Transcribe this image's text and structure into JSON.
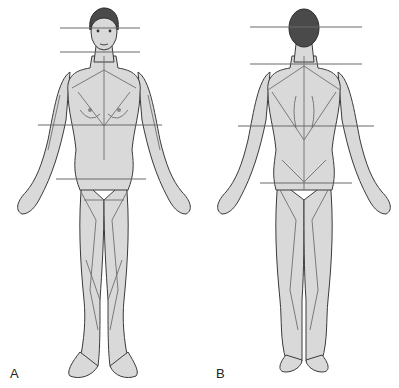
{
  "figure": {
    "panels": [
      {
        "id": "A",
        "label": "A",
        "view": "anterior"
      },
      {
        "id": "B",
        "label": "B",
        "view": "posterior"
      }
    ],
    "colors": {
      "background": "#ffffff",
      "skin": "#d9d9d9",
      "outline": "#3a3a3a",
      "hair": "#4a4a4a",
      "guide": "#6a6a6a"
    }
  }
}
